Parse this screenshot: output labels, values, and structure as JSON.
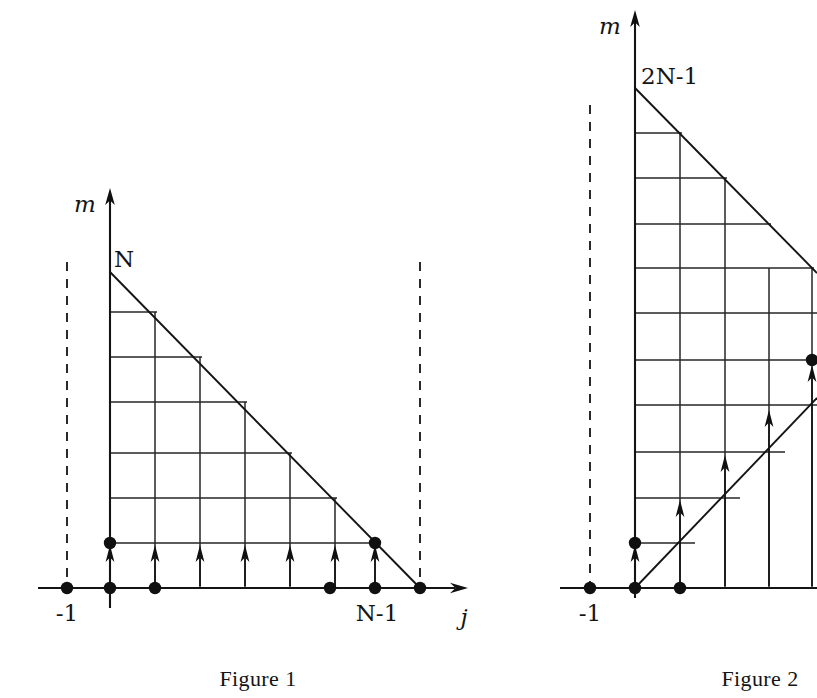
{
  "page": {
    "background_color": "#ffffff",
    "ink_color": "#141414",
    "width": 817,
    "height": 698
  },
  "figure1": {
    "caption": "Figure 1",
    "y_axis_label": "m",
    "x_axis_label": "j",
    "apex_label": "N",
    "x_tick_labels": [
      {
        "text": "-1",
        "value": -1
      },
      {
        "text": "N-1",
        "value": "N-1"
      }
    ],
    "geometry": {
      "origin_x": 110,
      "axis_y": 588,
      "apex_y": 272,
      "grid_step": 45,
      "columns": 7,
      "rows": 6,
      "hypotenuse_from": [
        110,
        272
      ],
      "hypotenuse_to": [
        420,
        588
      ]
    },
    "axis_dots_x": [
      67,
      110,
      155,
      330,
      375,
      420
    ],
    "lattice_dots": [
      {
        "x": 110,
        "y": 543
      },
      {
        "x": 375,
        "y": 543
      }
    ],
    "arrow_count": 7,
    "dashed_guides": [
      {
        "x": 67,
        "label": "-1"
      },
      {
        "x": 420,
        "label": "N"
      }
    ],
    "horizontal_grid_y": [
      312,
      357,
      402,
      453,
      498,
      543
    ],
    "vertical_grid_x": [
      110,
      155,
      200,
      245,
      290,
      335,
      375
    ]
  },
  "figure2": {
    "caption": "Figure 2",
    "y_axis_label": "m",
    "apex_label": "2N-1",
    "x_tick_labels": [
      {
        "text": "-1",
        "value": -1
      }
    ],
    "geometry": {
      "origin_x": 635,
      "axis_y": 588,
      "apex_y": 88,
      "grid_step": 45,
      "rows": 11,
      "upper_hypotenuse_from": [
        635,
        88
      ],
      "lower_hypotenuse_from": [
        635,
        588
      ]
    },
    "axis_dots_x": [
      590,
      635,
      680
    ],
    "lattice_dots": [
      {
        "x": 635,
        "y": 543
      },
      {
        "x": 812,
        "y": 360
      }
    ],
    "arrow_count": 6,
    "dashed_guides": [
      {
        "x": 590,
        "label": "-1"
      }
    ],
    "clipped_right_edge": true
  }
}
